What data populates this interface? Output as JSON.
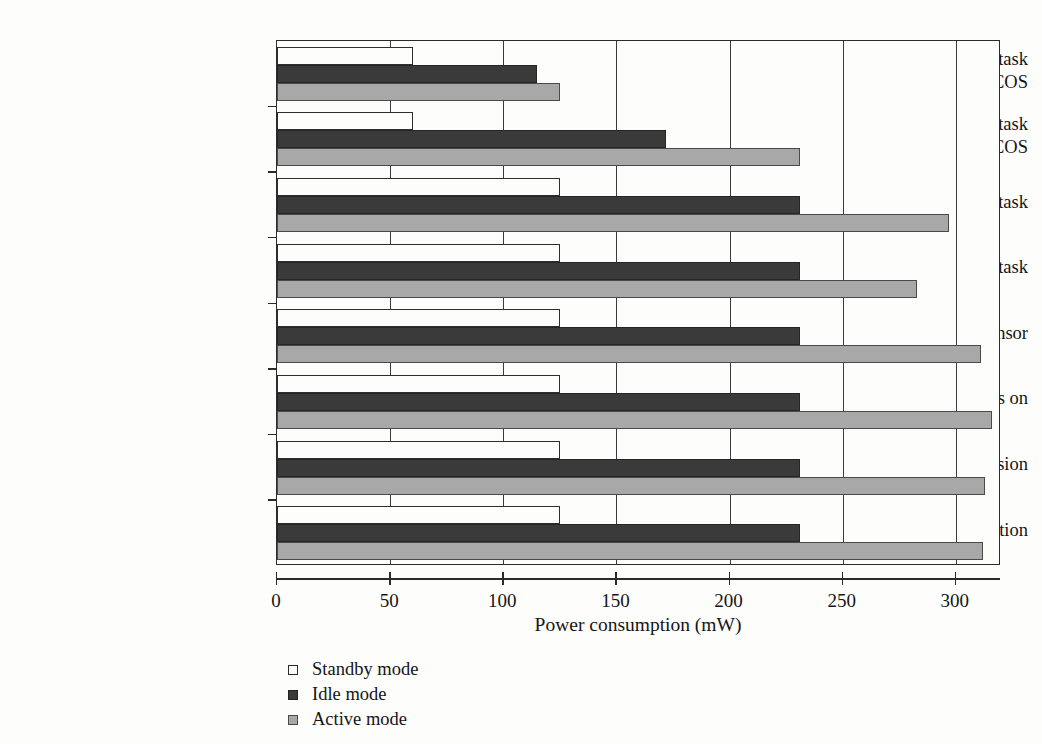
{
  "chart_data": {
    "type": "bar",
    "orientation": "horizontal",
    "title": "",
    "xlabel": "Power consumption (mW)",
    "ylabel": "",
    "xlim": [
      0,
      320
    ],
    "xticks": [
      0,
      50,
      100,
      150,
      200,
      250,
      300
    ],
    "xtick_labels": [
      "0",
      "50",
      "100",
      "150",
      "200",
      "250",
      "300"
    ],
    "grid": "vertical",
    "legend_position": "below-left",
    "categories": [
      "Processor-bound task w/13 MHz w/o POBICOS",
      "Processor-bound task w/o POBICOS",
      "Processor-bound task",
      "Memory-bound task",
      "Read light sensor",
      "Three leds on",
      "Radio transmission",
      "Radio reception"
    ],
    "category_label_lines": [
      [
        "Processor-bound task",
        "w/13 MHz w/o POBICOS"
      ],
      [
        "Processor-bound task",
        "w/o POBICOS"
      ],
      [
        "Processor-bound task"
      ],
      [
        "Memory-bound task"
      ],
      [
        "Read light sensor"
      ],
      [
        "Three leds on"
      ],
      [
        "Radio transmission"
      ],
      [
        "Radio reception"
      ]
    ],
    "series": [
      {
        "name": "Standby mode",
        "color": "#ffffff",
        "values": [
          60,
          60,
          125,
          125,
          125,
          125,
          125,
          125
        ]
      },
      {
        "name": "Idle mode",
        "color": "#3a3a3a",
        "values": [
          115,
          172,
          231,
          231,
          231,
          231,
          231,
          231
        ]
      },
      {
        "name": "Active mode",
        "color": "#a8a8a8",
        "values": [
          125,
          231,
          297,
          283,
          311,
          316,
          313,
          312
        ]
      }
    ],
    "legend": [
      {
        "label": "Standby mode",
        "swatch": "standby"
      },
      {
        "label": "Idle mode",
        "swatch": "idle"
      },
      {
        "label": "Active mode",
        "swatch": "active"
      }
    ]
  }
}
